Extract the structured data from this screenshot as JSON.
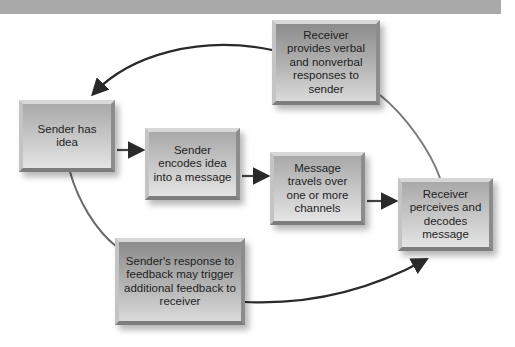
{
  "diagram": {
    "type": "communication-process-cycle",
    "header_bar_color": "#a9a9a9",
    "nodes": [
      {
        "id": "sender_has_idea",
        "label": "Sender has idea"
      },
      {
        "id": "sender_encodes",
        "label": "Sender encodes idea into a message"
      },
      {
        "id": "message_travels",
        "label": "Message travels over one or more channels"
      },
      {
        "id": "receiver_perceives",
        "label": "Receiver perceives and decodes message"
      },
      {
        "id": "receiver_provides",
        "label": "Receiver provides verbal and nonverbal responses to sender"
      },
      {
        "id": "sender_response",
        "label": "Sender's response to feedback may trigger additional feedback to receiver"
      }
    ],
    "edges": [
      {
        "from": "sender_has_idea",
        "to": "sender_encodes"
      },
      {
        "from": "sender_encodes",
        "to": "message_travels"
      },
      {
        "from": "message_travels",
        "to": "receiver_perceives"
      },
      {
        "from": "receiver_perceives",
        "to": "receiver_provides"
      },
      {
        "from": "receiver_provides",
        "to": "sender_has_idea"
      },
      {
        "from": "sender_has_idea",
        "to": "sender_response"
      },
      {
        "from": "sender_response",
        "to": "receiver_perceives"
      }
    ]
  }
}
